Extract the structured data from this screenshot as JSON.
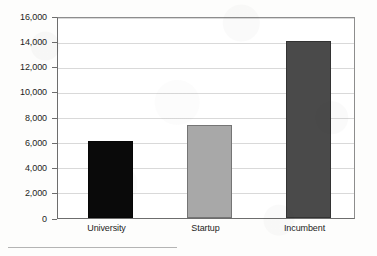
{
  "chart_data": {
    "type": "bar",
    "title": "",
    "xlabel": "",
    "ylabel": "",
    "categories": [
      "University",
      "Startup",
      "Incumbent"
    ],
    "values": [
      6150,
      7450,
      14200
    ],
    "series": [
      {
        "name": "Count",
        "values": [
          6150,
          7450,
          14200
        ],
        "colors": [
          "#0a0a0a",
          "#a8a8a8",
          "#4a4a4a"
        ]
      }
    ],
    "ylim": [
      0,
      16000
    ],
    "ytick_values": [
      0,
      2000,
      4000,
      6000,
      8000,
      10000,
      12000,
      14000,
      16000
    ],
    "ytick_labels": [
      "0",
      "2,000",
      "4,000",
      "6,000",
      "8,000",
      "10,000",
      "12,000",
      "14,000",
      "16,000"
    ],
    "grid": true,
    "grid_axis": "y",
    "legend": false,
    "legend_position": "none",
    "bar_colors": {
      "university": "#0a0a0a",
      "startup": "#a8a8a8",
      "incumbent": "#4a4a4a"
    }
  },
  "style": {
    "background": "#fdfdfc",
    "plot_background": "#ffffff",
    "gridline_color": "#d9d9d9",
    "axis_color": "#6d6d6d",
    "frame_color": "#8d8d8d",
    "text_color": "#1d1d1d"
  }
}
